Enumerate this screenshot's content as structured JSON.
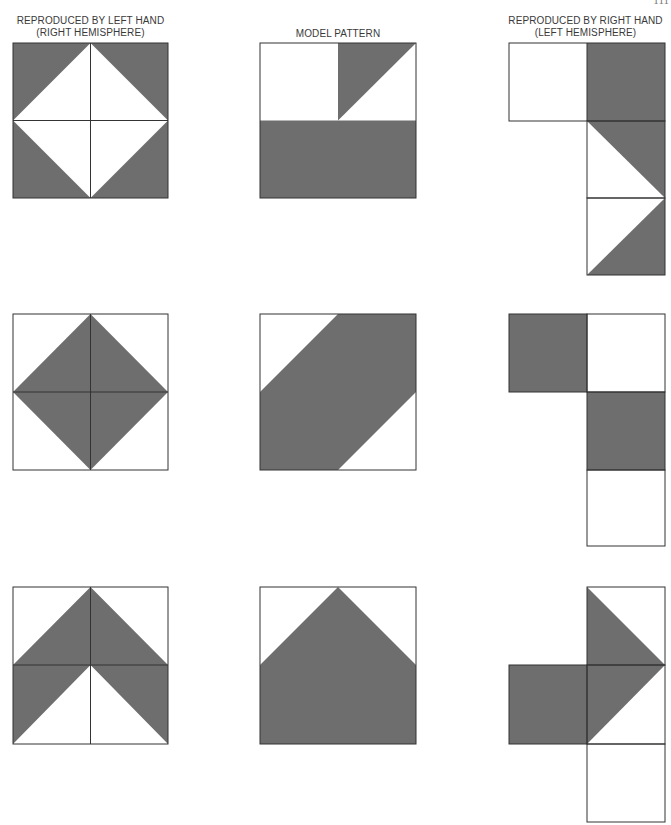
{
  "page": {
    "number": "111"
  },
  "columns": {
    "left": {
      "line1": "REPRODUCED BY LEFT HAND",
      "line2": "(RIGHT HEMISPHERE)"
    },
    "middle": {
      "line1": "MODEL PATTERN"
    },
    "right": {
      "line1": "REPRODUCED BY RIGHT HAND",
      "line2": "(LEFT HEMISPHERE)"
    }
  },
  "colors": {
    "fill": "#6e6e6e",
    "stroke": "#333333",
    "background": "#ffffff"
  },
  "rows": [
    {
      "model": "top-left white, top-right split diagonal (gray upper-left triangle), bottom half gray",
      "left_hand": "four quadrants with white diamond, gray corners",
      "right_hand": "vertical strip of squares: white+gray top row, then two triangle squares"
    },
    {
      "model": "gray diagonal band with white top-left and bottom-right triangles",
      "left_hand": "four quadrants with gray diamond, white corners",
      "right_hand": "gray/white top row, gray middle, white bottom square"
    },
    {
      "model": "gray house/pentagon shape with white top corners",
      "left_hand": "four quadrants forming gray chevron",
      "right_hand": "arrow shape: gray square left, triangles right column, empty bottom square"
    }
  ]
}
